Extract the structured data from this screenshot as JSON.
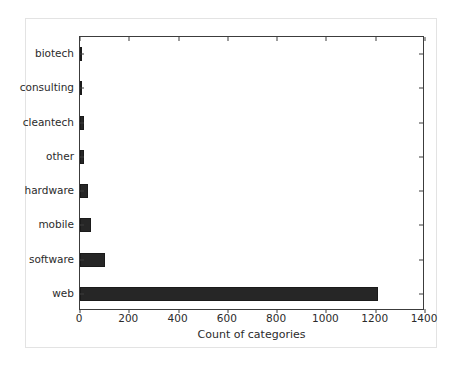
{
  "chart_data": {
    "type": "bar",
    "orientation": "horizontal",
    "title": "",
    "xlabel": "Count of categories",
    "ylabel": "",
    "categories": [
      "biotech",
      "consulting",
      "cleantech",
      "other",
      "hardware",
      "mobile",
      "software",
      "web"
    ],
    "values": [
      3,
      5,
      16,
      17,
      32,
      45,
      100,
      1210
    ],
    "xlim": [
      0,
      1400
    ],
    "xticks": [
      0,
      200,
      400,
      600,
      800,
      1000,
      1200,
      1400
    ],
    "xtick_labels": [
      "0",
      "200",
      "400",
      "600",
      "800",
      "1000",
      "1200",
      "1400"
    ],
    "grid": false,
    "legend": null,
    "bar_color": "#262626",
    "axis_color": "#3c3c3c",
    "background_color": "#ffffff",
    "figure_border_color": "#e3e3e3"
  }
}
